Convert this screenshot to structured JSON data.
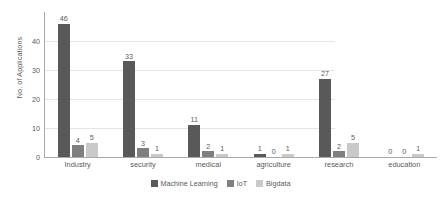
{
  "chart_data": {
    "type": "bar",
    "title": "",
    "subtitle": "",
    "xlabel": "",
    "ylabel": "No. of Applications",
    "categories": [
      "Industry",
      "security",
      "medical",
      "agriculture",
      "research",
      "education"
    ],
    "series": [
      {
        "name": "Machine Learning",
        "color": "#595959",
        "values": [
          46,
          33,
          11,
          1,
          27,
          0
        ]
      },
      {
        "name": "IoT",
        "color": "#7f7f7f",
        "values": [
          4,
          3,
          2,
          0,
          2,
          0
        ]
      },
      {
        "name": "Bigdata",
        "color": "#c9c9c9",
        "values": [
          5,
          1,
          1,
          1,
          5,
          1
        ]
      }
    ],
    "ylim": [
      0,
      50
    ],
    "yticks": [
      0,
      10,
      20,
      30,
      40
    ],
    "ytick_labels": [
      "0",
      "10",
      "20",
      "30",
      "40"
    ],
    "grid": true,
    "grid_axis": "y",
    "legend_position": "bottom-center",
    "data_labels": true,
    "axis_color": "#a9a9a9",
    "grid_color": "#e4e4e4",
    "text_color": "#595959"
  }
}
